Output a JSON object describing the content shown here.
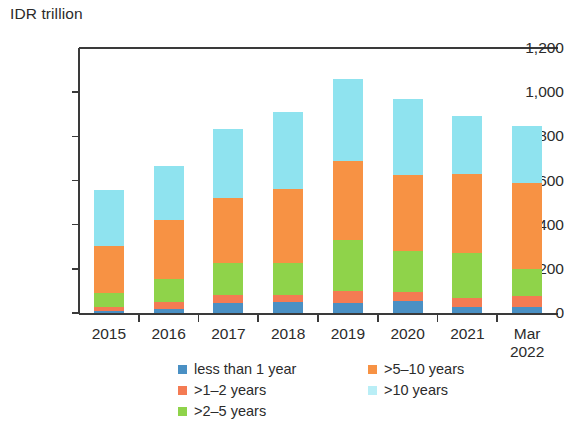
{
  "chart_data": {
    "type": "bar",
    "subtype": "stacked-bar",
    "title": "",
    "ylabel": "IDR trillion",
    "xlabel": "",
    "ylim": [
      0,
      1200
    ],
    "ytick_labels": [
      "0",
      "200",
      "400",
      "600",
      "800",
      "1,000",
      "1,200"
    ],
    "ytick_values": [
      0,
      200,
      400,
      600,
      800,
      1000,
      1200
    ],
    "grid": false,
    "legend_position": "bottom",
    "categories": [
      "2015",
      "2016",
      "2017",
      "2018",
      "2019",
      "2020",
      "2021",
      "Mar\n2022"
    ],
    "category_labels": [
      "2015",
      "2016",
      "2017",
      "2018",
      "2019",
      "2020",
      "2021",
      "Mar 2022"
    ],
    "series": [
      {
        "name": "less than 1 year",
        "color": "#4a90c4",
        "values": [
          10,
          20,
          45,
          50,
          45,
          55,
          25,
          25
        ]
      },
      {
        "name": ">1–2 years",
        "color": "#f47b53",
        "values": [
          15,
          30,
          35,
          30,
          55,
          40,
          45,
          50
        ]
      },
      {
        "name": ">2–5 years",
        "color": "#8fd34a",
        "values": [
          65,
          105,
          145,
          145,
          230,
          185,
          200,
          125
        ]
      },
      {
        "name": ">5–10 years",
        "color": "#f79244",
        "values": [
          215,
          265,
          295,
          335,
          360,
          345,
          360,
          390
        ]
      },
      {
        "name": ">10 years",
        "color": "#8fe3ef",
        "values": [
          250,
          245,
          315,
          350,
          370,
          345,
          260,
          255
        ]
      }
    ],
    "totals": [
      555,
      665,
      835,
      910,
      1060,
      970,
      890,
      845
    ]
  },
  "legend": {
    "columns": [
      {
        "items": [
          {
            "label": "less than 1 year",
            "color": "#4a90c4"
          },
          {
            "label": ">1–2 years",
            "color": "#f47b53"
          },
          {
            "label": ">2–5 years",
            "color": "#8fd34a"
          }
        ]
      },
      {
        "items": [
          {
            "label": ">5–10 years",
            "color": "#f79244"
          },
          {
            "label": ">10 years",
            "color": "#b9eef6"
          }
        ]
      }
    ]
  },
  "axis": {
    "y_title": "IDR trillion"
  },
  "colors": {
    "axis": "#3a3a3a",
    "text": "#2b2b2b",
    "background": "#ffffff"
  }
}
